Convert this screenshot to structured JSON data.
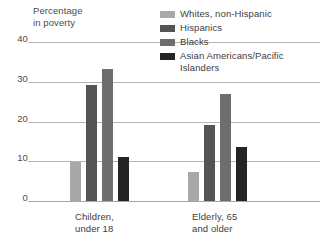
{
  "chart_data": {
    "type": "bar",
    "title": "",
    "ylabel": "Percentage\nin poverty",
    "xlabel": "",
    "ylim": [
      0,
      40
    ],
    "yticks": [
      "0",
      "10",
      "20",
      "30",
      "40"
    ],
    "ytick_values": [
      0,
      10,
      20,
      30,
      40
    ],
    "grid": true,
    "legend_position": "top-right",
    "categories": [
      "Children,\nunder 18",
      "Elderly, 65\nand older"
    ],
    "series": [
      {
        "name": "Whites, non-Hispanic",
        "color": "#a8a8a8",
        "values": [
          9.7,
          7.4
        ]
      },
      {
        "name": "Hispanics",
        "color": "#545454",
        "values": [
          29.2,
          19.0
        ]
      },
      {
        "name": "Blacks",
        "color": "#6e6e6e",
        "values": [
          33.2,
          26.8
        ]
      },
      {
        "name": "Asian Americans/Pacific\nIslanders",
        "color": "#242424",
        "values": [
          11.1,
          13.6
        ]
      }
    ]
  },
  "axis": {
    "ylabel_line1": "Percentage",
    "ylabel_line2": "in poverty",
    "tick_40": "40",
    "tick_30": "30",
    "tick_20": "20",
    "tick_10": "10",
    "tick_0": "0"
  },
  "legend": {
    "items": [
      {
        "label": "Whites, non-Hispanic",
        "color": "#a8a8a8"
      },
      {
        "label": "Hispanics",
        "color": "#545454"
      },
      {
        "label": "Blacks",
        "color": "#6e6e6e"
      },
      {
        "label": "Asian Americans/Pacific\nIslanders",
        "color": "#242424"
      }
    ]
  },
  "categories": {
    "children": "Children,\nunder 18",
    "elderly": "Elderly, 65\nand older"
  }
}
